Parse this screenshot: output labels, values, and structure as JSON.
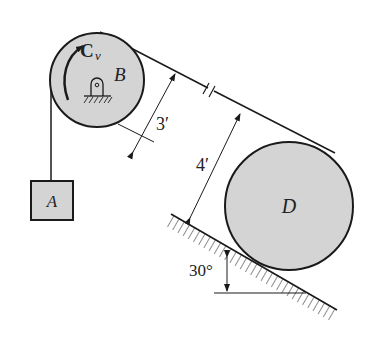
{
  "figure": {
    "type": "pulley-system-on-incline",
    "colors": {
      "disk_fill": "#d4d4d4",
      "stroke": "#1a1a1a",
      "background": "#ffffff"
    }
  },
  "labels": {
    "block": "A",
    "pulley_top": "B",
    "couple": "C",
    "couple_sub": "v",
    "pulley_bottom": "D",
    "dim_radius_B": "3′",
    "dim_radius_D": "4′",
    "angle": "30°"
  }
}
